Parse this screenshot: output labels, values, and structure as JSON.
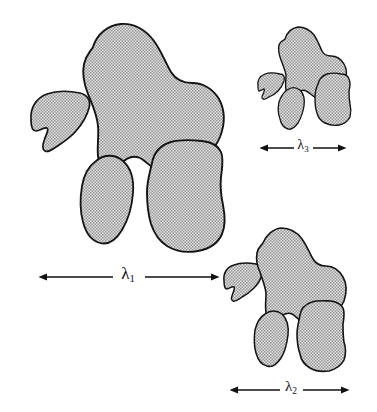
{
  "figure": {
    "background_color": "#ffffff",
    "outline_color": "#141414",
    "fill_pattern": "stippled-gray-checker",
    "fill_base_color": "#d9d9d9",
    "fill_dot_color": "#8c8c8c"
  },
  "scale_bars": [
    {
      "id": "lambda-1",
      "symbol": "λ",
      "subscript": "1",
      "label": "λ₁",
      "x_start": 47,
      "x_end": 211,
      "y": 277,
      "length_px": 164,
      "label_x": 128,
      "label_y": 275,
      "font_size": 17
    },
    {
      "id": "lambda-2",
      "symbol": "λ",
      "subscript": "2",
      "label": "λ₂",
      "x_start": 238,
      "x_end": 341,
      "y": 390,
      "length_px": 103,
      "label_x": 290,
      "label_y": 388,
      "font_size": 15
    },
    {
      "id": "lambda-3",
      "symbol": "λ",
      "subscript": "3",
      "label": "λ₃",
      "x_start": 268,
      "x_end": 338,
      "y": 148,
      "length_px": 70,
      "label_x": 303,
      "label_y": 146,
      "font_size": 14
    }
  ],
  "clusters": [
    {
      "id": "cluster-large",
      "scale_ref": "lambda-1",
      "name": "primary-cluster",
      "shape_count": 5,
      "bbox": [
        24,
        22,
        228,
        254
      ]
    },
    {
      "id": "cluster-medium",
      "scale_ref": "lambda-2",
      "name": "secondary-cluster",
      "shape_count": 5,
      "bbox": [
        222,
        222,
        365,
        372
      ]
    },
    {
      "id": "cluster-small",
      "scale_ref": "lambda-3",
      "name": "tertiary-cluster",
      "shape_count": 5,
      "bbox": [
        256,
        26,
        362,
        134
      ]
    }
  ],
  "shapes": {
    "cluster_large": [
      {
        "name": "blob-large-crescent",
        "role": "left-crescent",
        "path": "M 31 120 C 30 108 36 98 47 94 C 58 90 70 91 80 93 C 88 95 91 101 89 108 C 87 116 82 124 76 131 C 71 137 65 141 59 145 C 53 149 48 153 45 151 C 41 149 43 143 45 138 C 47 133 49 129 47 128 C 44 127 40 131 36 131 C 32 131 31 127 31 120 Z"
      },
      {
        "name": "blob-large-main",
        "role": "top-large",
        "path": "M 93 47 C 97 34 108 25 121 24 C 134 23 146 30 154 41 C 162 52 166 64 171 72 C 176 80 183 83 192 83 C 203 83 213 89 219 99 C 225 110 225 124 220 137 C 214 151 203 162 191 168 C 180 174 168 175 159 171 C 151 168 146 161 140 158 C 133 155 126 158 121 164 C 117 169 113 173 108 172 C 102 171 99 164 98 156 C 97 146 99 136 98 126 C 97 114 92 104 88 94 C 84 84 82 74 84 64 C 86 55 90 52 93 47 Z"
      },
      {
        "name": "blob-large-oval",
        "role": "lower-left-oval",
        "path": "M 96 161 C 104 154 115 154 123 161 C 131 168 134 180 133 193 C 132 207 128 220 122 230 C 116 240 108 245 100 243 C 92 241 86 233 83 222 C 80 211 80 198 82 186 C 84 174 89 166 96 161 Z"
      },
      {
        "name": "blob-large-square",
        "role": "lower-right-rounded",
        "path": "M 152 163 C 154 152 161 145 171 142 C 181 139 193 140 202 141 C 211 142 218 145 221 152 C 224 159 222 168 221 177 C 220 187 221 196 223 205 C 225 215 226 225 222 234 C 218 243 209 249 198 251 C 187 253 175 251 167 246 C 159 241 154 233 151 224 C 148 214 147 203 147 192 C 147 181 150 172 152 163 Z"
      },
      {
        "name": "blob-large-dot",
        "role": "hidden-fragment",
        "path": "M 0 0 Z"
      }
    ],
    "cluster_medium": [
      {
        "name": "blob-medium-crescent",
        "role": "left-crescent",
        "path": "M 224 281 C 223 273 227 267 234 265 C 242 262 250 263 256 264 C 261 265 263 269 262 274 C 261 279 258 284 254 288 C 250 292 246 295 242 297 C 238 300 235 302 233 301 C 230 300 232 296 233 293 C 234 290 235 288 234 287 C 232 286 229 289 227 289 C 225 289 224 286 224 281 Z"
      },
      {
        "name": "blob-medium-main",
        "role": "top-large",
        "path": "M 263 243 C 266 235 273 229 281 228 C 289 228 297 232 302 239 C 307 246 310 254 313 259 C 316 264 320 266 326 266 C 333 266 339 270 343 277 C 347 284 347 292 344 301 C 340 310 333 317 325 321 C 318 325 310 325 304 323 C 299 321 296 316 292 314 C 288 312 283 314 280 318 C 278 321 275 324 272 323 C 268 322 266 318 266 313 C 265 306 266 300 266 293 C 265 285 262 279 260 272 C 257 266 256 259 257 253 C 258 247 261 246 263 243 Z"
      },
      {
        "name": "blob-medium-oval",
        "role": "lower-left-oval",
        "path": "M 265 314 C 270 310 277 310 282 314 C 287 319 289 326 288 335 C 287 343 285 352 281 358 C 277 364 272 368 267 366 C 262 365 258 360 256 353 C 254 346 254 337 255 330 C 257 322 260 317 265 314 Z"
      },
      {
        "name": "blob-medium-square",
        "role": "lower-right-rounded",
        "path": "M 300 315 C 301 308 306 304 312 302 C 318 300 326 301 331 301 C 337 302 341 304 343 308 C 345 313 344 318 343 324 C 343 330 343 336 344 342 C 346 348 346 354 344 360 C 341 366 336 369 329 371 C 322 372 315 371 310 368 C 305 365 301 360 300 354 C 298 348 297 341 297 334 C 297 327 299 321 300 315 Z"
      },
      {
        "name": "blob-medium-dot",
        "role": "hidden-fragment",
        "path": "M 0 0 Z"
      }
    ],
    "cluster_small": [
      {
        "name": "blob-small-crescent",
        "role": "left-crescent",
        "path": "M 258 86 C 257 80 260 76 265 74 C 270 72 276 73 280 74 C 284 74 285 77 284 81 C 283 84 281 88 278 91 C 275 94 272 96 269 97 C 266 99 264 100 263 99 C 261 98 262 96 263 94 C 264 92 265 90 264 89 C 263 89 261 91 259 91 C 258 91 258 89 258 86 Z"
      },
      {
        "name": "blob-small-main",
        "role": "top-large",
        "path": "M 285 39 C 287 32 292 28 298 27 C 304 27 310 30 314 35 C 318 41 320 47 322 51 C 324 55 327 56 331 56 C 336 56 341 59 344 64 C 347 69 347 75 345 81 C 342 88 337 93 331 96 C 325 99 320 99 315 97 C 312 96 309 92 306 91 C 303 89 300 91 297 94 C 295 96 293 98 291 97 C 288 97 286 94 286 90 C 285 85 286 80 286 75 C 285 70 283 65 281 60 C 279 55 278 50 279 45 C 280 41 283 41 285 39 Z"
      },
      {
        "name": "blob-small-oval",
        "role": "lower-left-oval",
        "path": "M 287 90 C 291 87 296 87 300 90 C 304 94 305 99 304 106 C 303 112 301 118 298 123 C 295 127 291 130 288 129 C 284 128 281 124 280 119 C 278 114 278 107 279 102 C 281 96 283 93 287 90 Z"
      },
      {
        "name": "blob-small-square",
        "role": "lower-right-rounded",
        "path": "M 318 84 C 319 79 322 76 327 74 C 331 73 337 73 341 74 C 345 74 348 76 349 79 C 351 83 350 87 349 91 C 349 95 349 99 350 104 C 351 108 351 113 350 117 C 348 121 344 124 339 125 C 334 126 329 125 325 123 C 321 121 318 117 317 113 C 315 108 315 103 315 98 C 315 93 316 88 318 84 Z"
      },
      {
        "name": "blob-small-dot",
        "role": "hidden-fragment",
        "path": "M 0 0 Z"
      }
    ]
  }
}
